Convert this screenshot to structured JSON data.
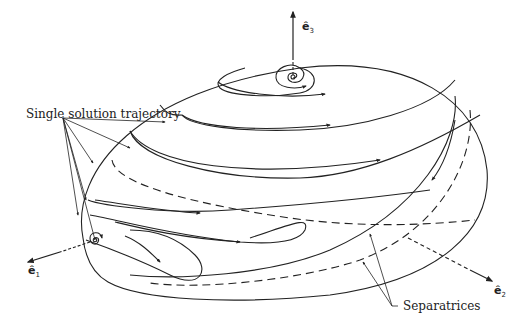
{
  "diagram": {
    "type": "phase-portrait-on-ellipsoid",
    "labels": {
      "trajectory": "Single solution trajectory",
      "separatrices": "Separatrices"
    },
    "axes": [
      {
        "name": "ê",
        "sub": "1"
      },
      {
        "name": "ê",
        "sub": "2"
      },
      {
        "name": "ê",
        "sub": "3"
      }
    ],
    "colors": {
      "line": "#222222",
      "background": "#ffffff"
    }
  }
}
